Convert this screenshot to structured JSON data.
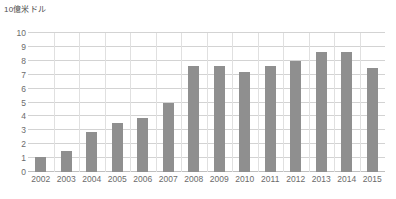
{
  "chart_data": {
    "type": "bar",
    "title": "10億米ドル",
    "xlabel": "",
    "ylabel": "10億米ドル",
    "categories": [
      "2002",
      "2003",
      "2004",
      "2005",
      "2006",
      "2007",
      "2008",
      "2009",
      "2010",
      "2011",
      "2012",
      "2013",
      "2014",
      "2015"
    ],
    "values": [
      1.1,
      1.5,
      2.9,
      3.5,
      3.9,
      5.0,
      7.6,
      7.6,
      7.2,
      7.6,
      8.0,
      8.6,
      8.6,
      7.5
    ],
    "yticks": [
      10,
      9,
      8,
      7,
      6,
      5,
      4,
      3,
      2,
      1,
      0
    ],
    "ylim": [
      0,
      10
    ],
    "grid": true,
    "legend": "none",
    "series": [
      {
        "name": "",
        "values": [
          1.1,
          1.5,
          2.9,
          3.5,
          3.9,
          5.0,
          7.6,
          7.6,
          7.2,
          7.6,
          8.0,
          8.6,
          8.6,
          7.5
        ]
      }
    ],
    "colors": {
      "bar": "#8f8f8f",
      "grid": "#d3d3d3",
      "text": "#6b6b6b",
      "background": "#ffffff"
    }
  }
}
